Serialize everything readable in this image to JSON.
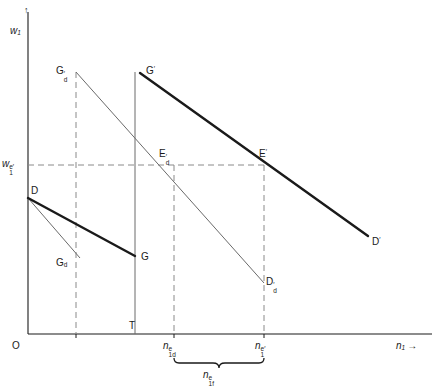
{
  "figure": {
    "type": "economics-diagram",
    "background": "#ffffff",
    "ink": "#1a1a1a",
    "thin_line": "#555555",
    "dashed_line": "#808080"
  },
  "axes": {
    "y_axis_label": "w",
    "y_axis_sub": "1",
    "y_axis_arrow": "↑",
    "x_axis_label": "n",
    "x_axis_sub": "1",
    "x_axis_arrow": "→",
    "origin_label": "O"
  },
  "ticks": {
    "y": [
      {
        "name": "equilibrium-wage",
        "base": "w",
        "sub": "1",
        "sup": "e′",
        "value_y": 165
      }
    ],
    "x": [
      {
        "name": "n1ed",
        "base": "n",
        "sub": "1d",
        "sup": "e",
        "value_x": 174
      },
      {
        "name": "n1e-prime",
        "base": "n",
        "sub": "1",
        "sup": "e′",
        "value_x": 264
      }
    ]
  },
  "points": [
    {
      "name": "Gd-prime",
      "base": "G",
      "sub": "d",
      "sup": "′",
      "x": 76,
      "y": 72
    },
    {
      "name": "G-prime",
      "base": "G",
      "sub": "",
      "sup": "′",
      "x": 140,
      "y": 72
    },
    {
      "name": "Ed-prime",
      "base": "E",
      "sub": "d",
      "sup": "′",
      "x": 163,
      "y": 165
    },
    {
      "name": "E-prime",
      "base": "E",
      "sub": "",
      "sup": "′",
      "x": 264,
      "y": 165
    },
    {
      "name": "D",
      "base": "D",
      "sub": "",
      "sup": "",
      "x": 28,
      "y": 198
    },
    {
      "name": "D-prime",
      "base": "D",
      "sub": "",
      "sup": "′",
      "x": 368,
      "y": 236
    },
    {
      "name": "Dd-prime",
      "base": "D",
      "sub": "d",
      "sup": "′",
      "x": 264,
      "y": 283
    },
    {
      "name": "Gd",
      "base": "G",
      "sub": "d",
      "sup": "",
      "x": 76,
      "y": 263
    },
    {
      "name": "G",
      "base": "G",
      "sub": "",
      "sup": "",
      "x": 135,
      "y": 258
    },
    {
      "name": "T",
      "base": "T",
      "sub": "",
      "sup": "",
      "x": 135,
      "y": 334
    }
  ],
  "brace": {
    "name": "n1f-bracket",
    "base": "n",
    "sub": "1f",
    "sup": "e",
    "from_x": 174,
    "to_x": 264
  }
}
